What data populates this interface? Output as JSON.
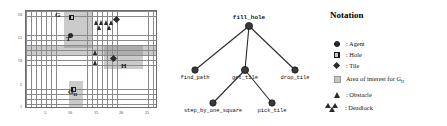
{
  "grid": {
    "x_ticks": [
      "5",
      "10",
      "15",
      "20",
      "25"
    ],
    "y_ticks": [
      "20",
      "15",
      "10",
      "5",
      "1"
    ],
    "x_range": [
      0,
      26
    ],
    "y_range": [
      0,
      21
    ],
    "labels": {
      "g": "G",
      "t": "T",
      "h": "H",
      "gh": "G",
      "gh_sub": "H"
    },
    "markers": [
      {
        "name": "hole-marker-g",
        "type": "hole",
        "x": 10,
        "y": 19.5
      },
      {
        "name": "agent-marker-t",
        "type": "agent",
        "x": 10,
        "y": 16.2
      },
      {
        "name": "tile-marker-top-right",
        "type": "tile",
        "x": 18.6,
        "y": 19.3
      },
      {
        "name": "tile-marker-h-region",
        "type": "tile",
        "x": 17.5,
        "y": 11.2
      },
      {
        "name": "hole-marker-gh",
        "type": "hole",
        "x": 10.2,
        "y": 4.1
      }
    ],
    "deadlocks": [
      {
        "name": "deadlock-cluster-top-left",
        "x": 15.6,
        "y": 18.6
      },
      {
        "name": "deadlock-cluster-top-mid",
        "x": 17.5,
        "y": 18.6
      },
      {
        "name": "deadlock-cluster-left-upper",
        "x": 15.4,
        "y": 12.6
      },
      {
        "name": "deadlock-cluster-left-lower",
        "x": 15.4,
        "y": 10.6
      }
    ],
    "areas_of_interest": [
      {
        "name": "aoi-vertical-band",
        "x": 7.6,
        "y_top": 20.6,
        "w": 5.4,
        "h": 7.4
      },
      {
        "name": "aoi-horizontal-band",
        "x": 15.4,
        "y_top": 13.4,
        "w": 7.6,
        "h": 4.6
      },
      {
        "name": "aoi-gh-band",
        "x": 8.6,
        "y_top": 6.2,
        "w": 2.6,
        "h": 5.4
      }
    ]
  },
  "tree": {
    "root": "fill_hole",
    "nodes": [
      {
        "id": "fill_hole",
        "label": "fill_hole",
        "x": 84,
        "y": 26,
        "level": 0
      },
      {
        "id": "find_path",
        "label": "find_path",
        "x": 30,
        "y": 70,
        "level": 1
      },
      {
        "id": "get_tile",
        "label": "get_tile",
        "x": 80,
        "y": 70,
        "level": 1
      },
      {
        "id": "drop_tile",
        "label": "drop_tile",
        "x": 130,
        "y": 70,
        "level": 1
      },
      {
        "id": "step_by_one_square",
        "label": "step_by_one_square",
        "x": 48,
        "y": 103,
        "level": 2
      },
      {
        "id": "pick_tile",
        "label": "pick_tile",
        "x": 107,
        "y": 103,
        "level": 2
      }
    ],
    "edges": [
      {
        "from": "fill_hole",
        "to": "find_path"
      },
      {
        "from": "fill_hole",
        "to": "get_tile"
      },
      {
        "from": "fill_hole",
        "to": "drop_tile"
      },
      {
        "from": "get_tile",
        "to": "step_by_one_square"
      },
      {
        "from": "get_tile",
        "to": "pick_tile"
      }
    ]
  },
  "legend": {
    "title": "Notation",
    "items": [
      {
        "name": "legend-agent",
        "symbol": "agent",
        "text": ": Agent"
      },
      {
        "name": "legend-hole",
        "symbol": "hole",
        "text": ": Hole"
      },
      {
        "name": "legend-tile",
        "symbol": "tile",
        "text": ": Tile"
      },
      {
        "name": "legend-area",
        "symbol": "area",
        "text": "Area of interest for G",
        "sub": "H"
      },
      {
        "name": "legend-obstacle",
        "symbol": "triangle",
        "text": ": Obstacle"
      },
      {
        "name": "legend-deadlock",
        "symbol": "deadlock",
        "text": ": Deadlock"
      }
    ]
  },
  "colors": {
    "grid_line": "#8a8a8a",
    "marker": "#2b2b2b",
    "aoi_fill": "#828282",
    "text": "#111111"
  }
}
